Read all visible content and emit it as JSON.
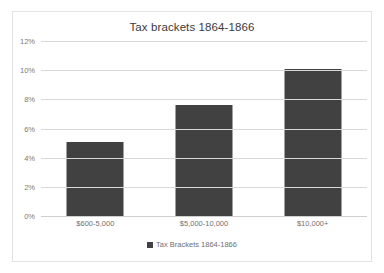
{
  "chart_data": {
    "type": "bar",
    "title": "Tax brackets 1864-1866",
    "categories": [
      "$600-5,000",
      "$5,000-10,000",
      "$10,000+"
    ],
    "values": [
      5.1,
      7.6,
      10.1
    ],
    "series": [
      {
        "name": "Tax Brackets 1864-1866",
        "values": [
          5.1,
          7.6,
          10.1
        ]
      }
    ],
    "xlabel": "",
    "ylabel": "",
    "ylim": [
      0,
      12
    ],
    "ytick_labels": [
      "0%",
      "2%",
      "4%",
      "6%",
      "8%",
      "10%",
      "12%"
    ],
    "ytick_values": [
      0,
      2,
      4,
      6,
      8,
      10,
      12
    ],
    "grid": true,
    "legend_position": "bottom",
    "bar_color": "#414141",
    "gridline_color": "#d9d9d9",
    "title_color": "#3b3b3b",
    "tick_label_color": "#7a7a7a",
    "plot_background": "#ffffff",
    "frame_border_color": "#e3e3e3"
  },
  "legend": {
    "items": [
      {
        "label": "Tax Brackets 1864-1866",
        "swatch": "legend-swatch-icon",
        "color": "#414141"
      }
    ]
  }
}
